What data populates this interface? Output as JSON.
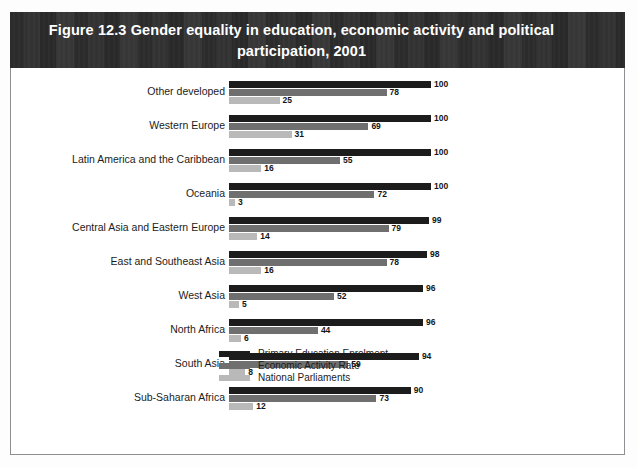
{
  "figure": {
    "title": "Figure 12.3 Gender equality in education, economic activity and political participation, 2001"
  },
  "colors": {
    "banner_background": "#2b2b2b",
    "banner_text": "#ffffff",
    "series_primary_education": "#1c1c1c",
    "series_economic_activity": "#6f6f6f",
    "series_national_parliaments": "#b9b9b9",
    "page_border": "#8d8f92"
  },
  "legend": {
    "position": "bottom-left-of-plot",
    "items": [
      {
        "label": "Primary Education Enrolment",
        "color": "#1c1c1c"
      },
      {
        "label": "Economic Activity Rate",
        "color": "#6f6f6f"
      },
      {
        "label": "National Parliaments",
        "color": "#b9b9b9"
      }
    ]
  },
  "chart_data": {
    "type": "bar",
    "orientation": "horizontal",
    "title": "Figure 12.3 Gender equality in education, economic activity and political participation, 2001",
    "subtitle": "",
    "xlabel": "",
    "ylabel": "",
    "xlim": [
      0,
      100
    ],
    "grid": false,
    "legend_position": "bottom",
    "value_labels": true,
    "categories": [
      "Other developed",
      "Western Europe",
      "Latin America and the Caribbean",
      "Oceania",
      "Central Asia and Eastern Europe",
      "East and Southeast Asia",
      "West Asia",
      "North Africa",
      "South Asia",
      "Sub-Saharan Africa"
    ],
    "series": [
      {
        "name": "Primary Education Enrolment",
        "color": "#1c1c1c",
        "values": [
          100,
          100,
          100,
          100,
          99,
          98,
          96,
          96,
          94,
          90
        ]
      },
      {
        "name": "Economic Activity Rate",
        "color": "#6f6f6f",
        "values": [
          78,
          69,
          55,
          72,
          79,
          78,
          52,
          44,
          59,
          73
        ]
      },
      {
        "name": "National Parliaments",
        "color": "#b9b9b9",
        "values": [
          25,
          31,
          16,
          3,
          14,
          16,
          5,
          6,
          8,
          12
        ]
      }
    ]
  }
}
